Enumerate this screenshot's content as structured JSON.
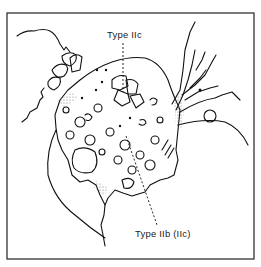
{
  "figure": {
    "labels": {
      "top": "Type IIc",
      "bottom": "Type IIb (IIc)"
    },
    "colors": {
      "line": "#111111",
      "background": "#ffffff",
      "stipple": "#888888"
    }
  }
}
